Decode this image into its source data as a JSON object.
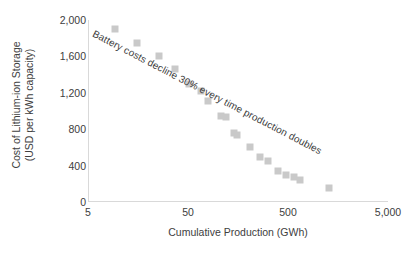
{
  "chart_data": {
    "type": "scatter",
    "title": "",
    "xlabel": "Cumulative Production (GWh)",
    "ylabel_line1": "Cost of Lithium-ion Storage",
    "ylabel_line2": "(USD per kWh capacity)",
    "xscale": "log",
    "xlim": [
      5,
      5000
    ],
    "ylim": [
      0,
      2000
    ],
    "xticks": [
      "5",
      "50",
      "500",
      "5,000"
    ],
    "xtick_values": [
      5,
      50,
      500,
      5000
    ],
    "yticks": [
      "0",
      "400",
      "800",
      "1,200",
      "1,600",
      "2,000"
    ],
    "ytick_values": [
      0,
      400,
      800,
      1200,
      1600,
      2000
    ],
    "grid": false,
    "legend": "none",
    "marker_color": "#c9c9c9",
    "marker_shape": "square",
    "annotations": [
      {
        "text": "Battery costs decline 30% every time production doubles",
        "rotation_deg": 27.5
      }
    ],
    "series": [
      {
        "name": "Lithium-ion battery pack cost",
        "points": [
          {
            "x": 9,
            "y": 1900
          },
          {
            "x": 15,
            "y": 1750
          },
          {
            "x": 25,
            "y": 1600
          },
          {
            "x": 36,
            "y": 1460
          },
          {
            "x": 50,
            "y": 1300
          },
          {
            "x": 66,
            "y": 1215
          },
          {
            "x": 78,
            "y": 1105
          },
          {
            "x": 104,
            "y": 940
          },
          {
            "x": 118,
            "y": 930
          },
          {
            "x": 140,
            "y": 760
          },
          {
            "x": 150,
            "y": 740
          },
          {
            "x": 205,
            "y": 605
          },
          {
            "x": 255,
            "y": 500
          },
          {
            "x": 310,
            "y": 455
          },
          {
            "x": 390,
            "y": 345
          },
          {
            "x": 470,
            "y": 295
          },
          {
            "x": 560,
            "y": 270
          },
          {
            "x": 640,
            "y": 240
          },
          {
            "x": 1250,
            "y": 155
          }
        ]
      }
    ]
  }
}
